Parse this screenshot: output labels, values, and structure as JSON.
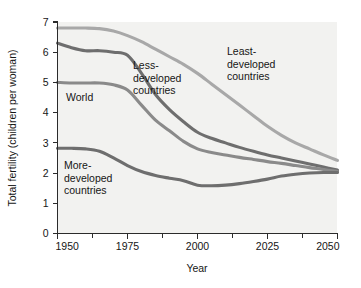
{
  "chart_data": {
    "type": "line",
    "title": "",
    "xlabel": "Year",
    "ylabel": "Total fertility (children per woman)",
    "xlim": [
      1950,
      2050
    ],
    "ylim": [
      0,
      7
    ],
    "xticks": [
      1950,
      1975,
      2000,
      2025,
      2050
    ],
    "xticks_minor": [
      1962.5,
      1987.5,
      2012.5,
      2037.5
    ],
    "yticks": [
      0,
      1,
      2,
      3,
      4,
      5,
      6,
      7
    ],
    "grid": false,
    "legend_position": "inline-annotations",
    "x": [
      1950,
      1955,
      1960,
      1965,
      1970,
      1975,
      1980,
      1985,
      1990,
      1995,
      2000,
      2005,
      2010,
      2015,
      2020,
      2025,
      2030,
      2035,
      2040,
      2045,
      2050
    ],
    "series": [
      {
        "name": "Least-developed countries",
        "color": "#a8a8a8",
        "values": [
          6.8,
          6.8,
          6.8,
          6.78,
          6.7,
          6.55,
          6.35,
          6.1,
          5.85,
          5.6,
          5.3,
          4.95,
          4.6,
          4.25,
          3.9,
          3.55,
          3.25,
          3.0,
          2.8,
          2.6,
          2.42
        ]
      },
      {
        "name": "Less-developed countries",
        "color": "#6e6e6e",
        "values": [
          6.3,
          6.15,
          6.05,
          6.05,
          6.0,
          5.9,
          5.3,
          4.6,
          4.1,
          3.7,
          3.35,
          3.15,
          3.0,
          2.85,
          2.72,
          2.6,
          2.5,
          2.4,
          2.3,
          2.2,
          2.1
        ]
      },
      {
        "name": "World",
        "color": "#8a8a8a",
        "values": [
          5.0,
          4.98,
          4.98,
          4.98,
          4.92,
          4.75,
          4.25,
          3.75,
          3.4,
          3.05,
          2.8,
          2.68,
          2.6,
          2.52,
          2.45,
          2.38,
          2.32,
          2.25,
          2.18,
          2.12,
          2.05
        ]
      },
      {
        "name": "More-developed countries",
        "color": "#6e6e6e",
        "values": [
          2.82,
          2.82,
          2.8,
          2.72,
          2.5,
          2.25,
          2.05,
          1.92,
          1.83,
          1.75,
          1.6,
          1.58,
          1.6,
          1.65,
          1.72,
          1.8,
          1.9,
          1.96,
          2.0,
          2.02,
          2.02
        ]
      }
    ],
    "annotations": [
      {
        "text_lines": [
          "Least-",
          "developed",
          "countries"
        ],
        "x": 227,
        "y": 55
      },
      {
        "text_lines": [
          "Less-",
          "developed",
          "countries"
        ],
        "x": 133,
        "y": 69
      },
      {
        "text_lines": [
          "World"
        ],
        "x": 66,
        "y": 101
      },
      {
        "text_lines": [
          "More-",
          "developed",
          "countries"
        ],
        "x": 64,
        "y": 169
      }
    ]
  },
  "axis": {
    "y_title": "Total fertility (children per woman)",
    "x_title": "Year",
    "y_tick_labels": [
      "7",
      "6",
      "5",
      "4",
      "3",
      "2",
      "1",
      "0"
    ],
    "x_tick_labels": [
      "1950",
      "1975",
      "2000",
      "2025",
      "2050"
    ]
  }
}
